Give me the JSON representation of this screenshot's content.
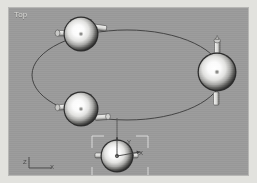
{
  "window": {
    "title": "Top",
    "view_label": "Top"
  },
  "viewport": {
    "label": "Top",
    "background_color": "#9a9a9a",
    "border_color": "#b7b7b5",
    "width": 241,
    "height": 169
  },
  "axis_tripod": {
    "name": "world-axis-tripod",
    "axes": [
      {
        "label": "Z",
        "direction": "up-left"
      },
      {
        "label": "X",
        "direction": "right"
      }
    ],
    "z_label": "Z",
    "x_label": "X",
    "color": "#4a4a4a"
  },
  "gizmo": {
    "name": "transform-gizmo",
    "x_label": "X",
    "y_label": "Y",
    "color": "#3f3f3f",
    "center": {
      "x": 108,
      "y": 146
    }
  },
  "selection": {
    "selected_object": "object-4",
    "bracket_color": "#dcdcd8",
    "bracket": {
      "x": 83,
      "y": 128,
      "width": 56,
      "height": 43
    }
  },
  "path": {
    "name": "ellipse-path-spline",
    "type": "ellipse",
    "center": {
      "x": 118,
      "y": 67
    },
    "radius_x": 95,
    "radius_y": 45,
    "stroke": "#3c3c3c",
    "stroke_width": 0.9
  },
  "objects": [
    {
      "id": "object-1",
      "name": "sphere-top",
      "center": {
        "x": 72,
        "y": 26
      },
      "radius": 17,
      "orientation": "horizontal",
      "label": "Top sphere"
    },
    {
      "id": "object-2",
      "name": "sphere-right",
      "center": {
        "x": 208,
        "y": 64
      },
      "radius": 19,
      "orientation": "vertical",
      "label": "Right sphere"
    },
    {
      "id": "object-3",
      "name": "sphere-middle-left",
      "center": {
        "x": 72,
        "y": 101
      },
      "radius": 17,
      "orientation": "horizontal",
      "label": "Middle left sphere"
    },
    {
      "id": "object-4",
      "name": "sphere-selected",
      "center": {
        "x": 108,
        "y": 148
      },
      "radius": 16,
      "orientation": "horizontal",
      "label": "Selected sphere"
    }
  ],
  "connector": {
    "name": "link-line",
    "from": {
      "x": 108,
      "y": 112
    },
    "to": {
      "x": 108,
      "y": 148
    },
    "stroke": "#4a4a4a"
  },
  "colors": {
    "viewport_bg": "#9a9a9a",
    "page_bg": "#e2e2de",
    "object_highlight": "#ffffff",
    "object_shadow": "#2e2e2e",
    "spline": "#3c3c3c",
    "label_text": "#d6d6d2"
  }
}
